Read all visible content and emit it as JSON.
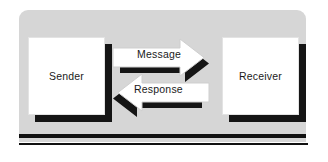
{
  "diagram": {
    "background_color": "#ffffff",
    "panel_color": "#d6d6d6",
    "shadow_color": "#151515",
    "node_fill": "#ffffff",
    "text_color": "#1a1a1a",
    "nodes": [
      {
        "id": "sender",
        "label": "Sender"
      },
      {
        "id": "receiver",
        "label": "Receiver"
      }
    ],
    "arrows": [
      {
        "id": "message",
        "label": "Message",
        "direction": "right",
        "from": "sender",
        "to": "receiver"
      },
      {
        "id": "response",
        "label": "Response",
        "direction": "left",
        "from": "receiver",
        "to": "sender"
      }
    ],
    "rules": [
      {
        "id": "rule-thick",
        "thickness": 4
      },
      {
        "id": "rule-thin",
        "thickness": 2
      }
    ]
  }
}
